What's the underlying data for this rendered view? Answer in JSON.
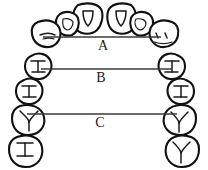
{
  "diagram": {
    "view": "occlusal-view-maxillary-arch",
    "background_color": "#ffffff",
    "outline_color": "#111111",
    "line_color": "#3a3a3a",
    "label_color": "#1a1a1a"
  },
  "measurements": [
    {
      "id": "A",
      "label": "A",
      "label_x": 103,
      "label_y": 47,
      "line_x1": 43,
      "line_x2": 161,
      "line_y": 37
    },
    {
      "id": "B",
      "label": "B",
      "label_x": 101,
      "label_y": 79,
      "line_x1": 41,
      "line_x2": 172,
      "line_y": 69
    },
    {
      "id": "C",
      "label": "C",
      "label_x": 100,
      "label_y": 124,
      "line_x1": 27,
      "line_x2": 177,
      "line_y": 114
    }
  ],
  "teeth": {
    "left_quadrant": [
      {
        "name": "central-incisor-left",
        "mark": "lingual-fossa"
      },
      {
        "name": "lateral-incisor-left",
        "mark": "lingual-fossa"
      },
      {
        "name": "canine-left",
        "mark": "cusp-ridge"
      },
      {
        "name": "first-premolar-left",
        "mark": "two-cusp"
      },
      {
        "name": "second-premolar-left",
        "mark": "two-cusp"
      },
      {
        "name": "first-molar-left",
        "mark": "y-groove"
      },
      {
        "name": "second-molar-left",
        "mark": "cross-groove"
      }
    ],
    "right_quadrant": [
      {
        "name": "central-incisor-right",
        "mark": "lingual-fossa"
      },
      {
        "name": "lateral-incisor-right",
        "mark": "lingual-fossa"
      },
      {
        "name": "canine-right",
        "mark": "cusp-ridge"
      },
      {
        "name": "first-premolar-right",
        "mark": "two-cusp"
      },
      {
        "name": "second-premolar-right",
        "mark": "two-cusp"
      },
      {
        "name": "first-molar-right",
        "mark": "y-groove"
      },
      {
        "name": "second-molar-right",
        "mark": "cross-groove"
      }
    ]
  }
}
